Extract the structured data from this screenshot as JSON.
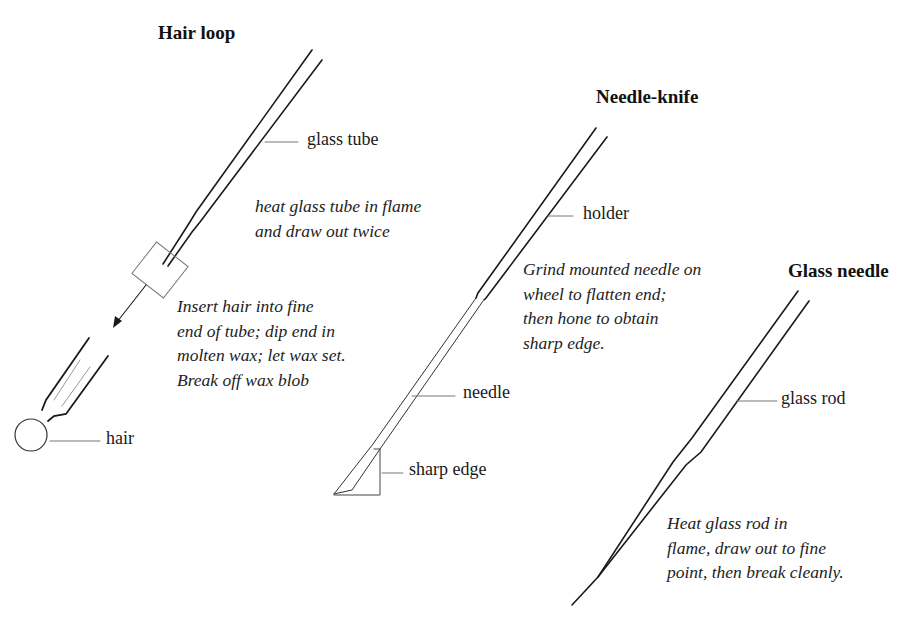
{
  "figure": {
    "panels": [
      {
        "id": "hair-loop",
        "title": "Hair loop",
        "labels": {
          "glass_tube": "glass tube",
          "hair": "hair"
        },
        "notes": {
          "heat": [
            "heat glass tube in flame",
            "and draw out twice"
          ],
          "insert": [
            "Insert hair into fine",
            "end of tube; dip end in",
            "molten wax; let wax set.",
            "Break off wax blob"
          ]
        }
      },
      {
        "id": "needle-knife",
        "title": "Needle-knife",
        "labels": {
          "holder": "holder",
          "needle": "needle",
          "sharp_edge": "sharp edge"
        },
        "notes": {
          "grind": [
            "Grind mounted needle on",
            "wheel to flatten end;",
            "then hone to obtain",
            "sharp edge."
          ]
        }
      },
      {
        "id": "glass-needle",
        "title": "Glass needle",
        "labels": {
          "glass_rod": "glass rod"
        },
        "notes": {
          "heat": [
            "Heat glass rod in",
            "flame, draw out to fine",
            "point, then break cleanly."
          ]
        }
      }
    ],
    "colors": {
      "ink": "#1a1a1a",
      "leader": "#555555",
      "background": "#ffffff"
    }
  }
}
